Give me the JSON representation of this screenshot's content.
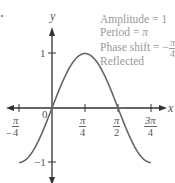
{
  "chart_data": {
    "type": "line",
    "title": "",
    "xlabel": "x",
    "ylabel": "y",
    "function_shape": "sine wave through origin, peak at pi/4",
    "x_ticks": [
      "-π/4",
      "0",
      "π/4",
      "π/2",
      "3π/4"
    ],
    "x_tick_values": [
      -0.7854,
      0,
      0.7854,
      1.5708,
      2.3562
    ],
    "y_ticks": [
      "1",
      "-1"
    ],
    "y_tick_values": [
      1,
      -1
    ],
    "xlim": [
      -0.95,
      2.55
    ],
    "ylim": [
      -1.5,
      1.5
    ],
    "series": [
      {
        "name": "curve",
        "x": [
          -0.7854,
          -0.3927,
          0,
          0.3927,
          0.7854,
          1.1781,
          1.5708,
          1.9635,
          2.3562
        ],
        "y": [
          -1,
          -0.7071,
          0,
          0.7071,
          1,
          0.7071,
          0,
          -0.7071,
          -1
        ]
      }
    ],
    "annotations": [
      "Amplitude = 1",
      "Period = π",
      "Phase shift = -π/4",
      "Reflected"
    ],
    "grid": false,
    "legend": null
  },
  "labels": {
    "axis_x": "x",
    "axis_y": "y",
    "origin": "0",
    "y_pos": "1",
    "y_neg": "−1",
    "tick_neg_pi4": {
      "sign": "−",
      "num": "π",
      "den": "4"
    },
    "tick_pi4": {
      "num": "π",
      "den": "4"
    },
    "tick_pi2": {
      "num": "π",
      "den": "2"
    },
    "tick_3pi4": {
      "num": "3π",
      "den": "4"
    }
  },
  "annotation": {
    "amplitude": "Amplitude = 1",
    "period_prefix": "Period = ",
    "period_value": "π",
    "phase_prefix": "Phase shift = −",
    "phase_num": "π",
    "phase_den": "4",
    "reflected": "Reflected"
  },
  "colors": {
    "axes": "#333333",
    "curve": "#666666",
    "annotation_text": "#9a9a9a"
  }
}
